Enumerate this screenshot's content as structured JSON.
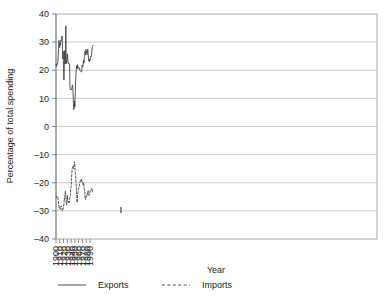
{
  "chart_data": {
    "type": "line",
    "title": "",
    "xlabel": "Year",
    "ylabel": "Percentage of total spending",
    "xlim": [
      1900,
      1999
    ],
    "ylim": [
      -40,
      40
    ],
    "grid": true,
    "legend_position": "bottom",
    "xticks": [
      "1900",
      "1910",
      "1920",
      "1930",
      "1940",
      "1950",
      "1960",
      "1970",
      "1980",
      "1990"
    ],
    "xtick_values": [
      1900,
      1910,
      1920,
      1930,
      1940,
      1950,
      1960,
      1970,
      1980,
      1990
    ],
    "yticks": [
      "40",
      "30",
      "20",
      "10",
      "0",
      "–10",
      "–20",
      "–30",
      "–40"
    ],
    "ytick_values": [
      40,
      30,
      20,
      10,
      0,
      -10,
      -20,
      -30,
      -40
    ],
    "x": [
      1900,
      1901,
      1902,
      1903,
      1904,
      1905,
      1906,
      1907,
      1908,
      1909,
      1910,
      1911,
      1912,
      1913,
      1914,
      1915,
      1916,
      1917,
      1918,
      1919,
      1920,
      1921,
      1922,
      1923,
      1924,
      1925,
      1926,
      1927,
      1928,
      1929,
      1930,
      1931,
      1932,
      1933,
      1934,
      1935,
      1936,
      1937,
      1938,
      1939,
      1940,
      1941,
      1942,
      1943,
      1944,
      1945,
      1946,
      1947,
      1948,
      1949,
      1950,
      1951,
      1952,
      1953,
      1954,
      1955,
      1956,
      1957,
      1958,
      1959,
      1960,
      1961,
      1962,
      1963,
      1964,
      1965,
      1966,
      1967,
      1968,
      1969,
      1970,
      1971,
      1972,
      1973,
      1974,
      1975,
      1976,
      1977,
      1978,
      1979,
      1980,
      1981,
      1982,
      1983,
      1984,
      1985,
      1986,
      1987,
      1988,
      1989,
      1990,
      1991,
      1992,
      1993,
      1994,
      1995,
      1996,
      1997,
      1998
    ],
    "series": [
      {
        "name": "Exports",
        "style": "solid",
        "color": "#3a3a3a",
        "values": [
          22.2,
          21.3,
          21.6,
          22.3,
          22.2,
          23.0,
          25.5,
          27.8,
          30.6,
          28.0,
          28.1,
          29.5,
          29.0,
          30.8,
          30.5,
          31.0,
          32.2,
          29.5,
          24.0,
          26.8,
          20.5,
          16.5,
          21.5,
          27.0,
          22.5,
          22.2,
          35.8,
          24.0,
          22.4,
          23.5,
          25.8,
          24.5,
          23.0,
          22.3,
          22.4,
          22.2,
          22.3,
          14.0,
          13.1,
          13.0,
          13.2,
          13.0,
          13.5,
          14.5,
          14.8,
          12.5,
          8.5,
          6.0,
          6.5,
          9.0,
          7.0,
          12.5,
          16.0,
          19.0,
          20.8,
          21.6,
          20.5,
          22.0,
          21.3,
          20.7,
          21.0,
          21.0,
          20.8,
          20.1,
          19.8,
          19.6,
          19.5,
          19.4,
          19.5,
          21.8,
          21.5,
          21.2,
          22.5,
          23.5,
          22.5,
          24.5,
          25.0,
          26.8,
          25.5,
          27.4,
          26.9,
          26.0,
          25.5,
          26.2,
          27.5,
          26.0,
          24.0,
          23.3,
          23.9,
          23.0,
          23.5,
          24.5,
          25.0,
          24.8,
          25.5,
          27.2,
          28.0,
          28.5,
          28.8
        ]
      },
      {
        "name": "Imports",
        "style": "dashed",
        "color": "#3a3a3a",
        "values": [
          -25.0,
          -25.0,
          -24.8,
          -25.2,
          -25.0,
          -25.2,
          -26.0,
          -27.5,
          -28.5,
          -29.0,
          -28.8,
          -29.5,
          -29.0,
          -28.2,
          -28.5,
          -29.0,
          -29.2,
          -30.0,
          -29.5,
          -29.3,
          -28.5,
          -27.5,
          -25.5,
          -26.0,
          -23.5,
          -23.0,
          -24.5,
          -26.5,
          -27.8,
          -27.0,
          -24.5,
          -26.0,
          -26.5,
          -27.0,
          -26.5,
          -27.2,
          -26.0,
          -25.0,
          -24.5,
          -22.0,
          -21.5,
          -18.5,
          -16.5,
          -15.0,
          -14.5,
          -14.0,
          -14.5,
          -15.0,
          -13.5,
          -12.5,
          -14.0,
          -16.5,
          -17.5,
          -20.0,
          -22.0,
          -25.0,
          -27.0,
          -24.5,
          -23.5,
          -22.5,
          -22.0,
          -21.5,
          -21.0,
          -20.0,
          -19.5,
          -19.0,
          -19.2,
          -19.5,
          -18.8,
          -19.5,
          -20.0,
          -20.5,
          -20.8,
          -20.0,
          -21.0,
          -22.5,
          -23.0,
          -25.5,
          -26.0,
          -25.5,
          -24.5,
          -25.0,
          -24.5,
          -24.0,
          -23.0,
          -22.8,
          -23.5,
          -24.5,
          -24.0,
          -23.5,
          -23.0,
          -23.2,
          -23.0,
          -22.5,
          -22.3,
          -22.0,
          -22.5,
          -23.0,
          -23.5
        ]
      }
    ]
  },
  "legend": {
    "items": [
      {
        "label": "Exports",
        "style": "solid"
      },
      {
        "label": "Imports",
        "style": "dashed"
      }
    ]
  }
}
